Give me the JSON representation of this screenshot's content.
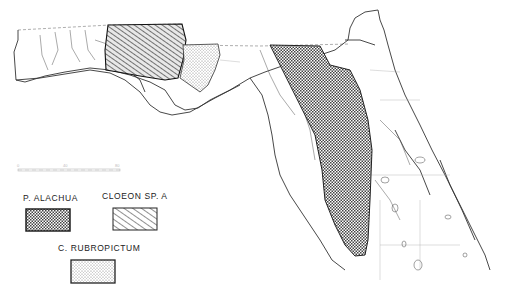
{
  "map": {
    "subject": "Florida distribution map",
    "scale_bar": {
      "labels": [
        "0",
        "40",
        "80"
      ]
    }
  },
  "legend": {
    "items": [
      {
        "label": "P. ALACHUA",
        "pattern": "crosshatch",
        "color": "#333333"
      },
      {
        "label": "CLOEON  SP. A",
        "pattern": "diagonal-hatch",
        "color": "#333333"
      },
      {
        "label": "C. RUBROPICTUM",
        "pattern": "stipple",
        "color": "#555555"
      }
    ]
  }
}
